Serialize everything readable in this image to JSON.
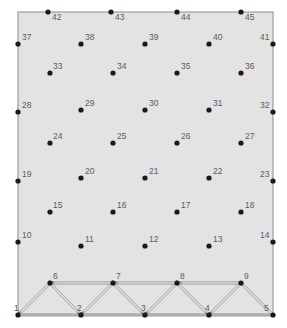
{
  "figure": {
    "type": "mesh-truss-diagram",
    "width": 287,
    "height": 328,
    "background_color": "#ffffff",
    "domain_fill_color": "#e3e3e3",
    "domain_stroke_color": "#8c8c8c",
    "node_color": "#1a1a1a",
    "member_color": "#8a8a8a",
    "label_color": "#5c5c5c",
    "domain_rect": {
      "x": 18,
      "y": 12,
      "width": 255,
      "height": 303
    },
    "node_radius": 2.6,
    "label_font_size": 8.5
  },
  "nodes": [
    {
      "id": "1",
      "label": "1",
      "x": 18,
      "y": 315,
      "lx": 14,
      "ly": 304,
      "role": "truss-bottom-corner"
    },
    {
      "id": "2",
      "label": "2",
      "x": 81,
      "y": 315,
      "lx": 77,
      "ly": 304,
      "role": "truss-bottom"
    },
    {
      "id": "3",
      "label": "3",
      "x": 145,
      "y": 315,
      "lx": 141,
      "ly": 304,
      "role": "truss-bottom"
    },
    {
      "id": "4",
      "label": "4",
      "x": 209,
      "y": 315,
      "lx": 205,
      "ly": 304,
      "role": "truss-bottom"
    },
    {
      "id": "5",
      "label": "5",
      "x": 273,
      "y": 315,
      "lx": 264,
      "ly": 304,
      "role": "truss-bottom-corner"
    },
    {
      "id": "6",
      "label": "6",
      "x": 50,
      "y": 283,
      "lx": 53,
      "ly": 272,
      "role": "truss-top"
    },
    {
      "id": "7",
      "label": "7",
      "x": 113,
      "y": 283,
      "lx": 116,
      "ly": 272,
      "role": "truss-top"
    },
    {
      "id": "8",
      "label": "8",
      "x": 177,
      "y": 283,
      "lx": 180,
      "ly": 272,
      "role": "truss-top"
    },
    {
      "id": "9",
      "label": "9",
      "x": 241,
      "y": 283,
      "lx": 244,
      "ly": 272,
      "role": "truss-top"
    },
    {
      "id": "10",
      "label": "10",
      "x": 18,
      "y": 242,
      "lx": 22,
      "ly": 231,
      "role": "boundary-left"
    },
    {
      "id": "11",
      "label": "11",
      "x": 81,
      "y": 246,
      "lx": 85,
      "ly": 235,
      "role": "interior"
    },
    {
      "id": "12",
      "label": "12",
      "x": 145,
      "y": 246,
      "lx": 149,
      "ly": 235,
      "role": "interior"
    },
    {
      "id": "13",
      "label": "13",
      "x": 209,
      "y": 246,
      "lx": 213,
      "ly": 235,
      "role": "interior"
    },
    {
      "id": "14",
      "label": "14",
      "x": 273,
      "y": 242,
      "lx": 260,
      "ly": 231,
      "role": "boundary-right"
    },
    {
      "id": "15",
      "label": "15",
      "x": 50,
      "y": 212,
      "lx": 53,
      "ly": 201,
      "role": "interior"
    },
    {
      "id": "16",
      "label": "16",
      "x": 113,
      "y": 212,
      "lx": 117,
      "ly": 201,
      "role": "interior"
    },
    {
      "id": "17",
      "label": "17",
      "x": 177,
      "y": 212,
      "lx": 181,
      "ly": 201,
      "role": "interior"
    },
    {
      "id": "18",
      "label": "18",
      "x": 241,
      "y": 212,
      "lx": 245,
      "ly": 201,
      "role": "interior"
    },
    {
      "id": "19",
      "label": "19",
      "x": 18,
      "y": 181,
      "lx": 22,
      "ly": 170,
      "role": "boundary-left"
    },
    {
      "id": "20",
      "label": "20",
      "x": 81,
      "y": 178,
      "lx": 85,
      "ly": 167,
      "role": "interior"
    },
    {
      "id": "21",
      "label": "21",
      "x": 145,
      "y": 178,
      "lx": 149,
      "ly": 167,
      "role": "interior"
    },
    {
      "id": "22",
      "label": "22",
      "x": 209,
      "y": 178,
      "lx": 213,
      "ly": 167,
      "role": "interior"
    },
    {
      "id": "23",
      "label": "23",
      "x": 273,
      "y": 181,
      "lx": 260,
      "ly": 170,
      "role": "boundary-right"
    },
    {
      "id": "24",
      "label": "24",
      "x": 50,
      "y": 143,
      "lx": 53,
      "ly": 132,
      "role": "interior"
    },
    {
      "id": "25",
      "label": "25",
      "x": 113,
      "y": 143,
      "lx": 117,
      "ly": 132,
      "role": "interior"
    },
    {
      "id": "26",
      "label": "26",
      "x": 177,
      "y": 143,
      "lx": 181,
      "ly": 132,
      "role": "interior"
    },
    {
      "id": "27",
      "label": "27",
      "x": 241,
      "y": 143,
      "lx": 245,
      "ly": 132,
      "role": "interior"
    },
    {
      "id": "28",
      "label": "28",
      "x": 18,
      "y": 112,
      "lx": 22,
      "ly": 101,
      "role": "boundary-left"
    },
    {
      "id": "29",
      "label": "29",
      "x": 81,
      "y": 110,
      "lx": 85,
      "ly": 99,
      "role": "interior"
    },
    {
      "id": "30",
      "label": "30",
      "x": 145,
      "y": 110,
      "lx": 149,
      "ly": 99,
      "role": "interior"
    },
    {
      "id": "31",
      "label": "31",
      "x": 209,
      "y": 110,
      "lx": 213,
      "ly": 99,
      "role": "interior"
    },
    {
      "id": "32",
      "label": "32",
      "x": 273,
      "y": 112,
      "lx": 260,
      "ly": 101,
      "role": "boundary-right"
    },
    {
      "id": "33",
      "label": "33",
      "x": 50,
      "y": 73,
      "lx": 53,
      "ly": 62,
      "role": "interior"
    },
    {
      "id": "34",
      "label": "34",
      "x": 113,
      "y": 73,
      "lx": 117,
      "ly": 62,
      "role": "interior"
    },
    {
      "id": "35",
      "label": "35",
      "x": 177,
      "y": 73,
      "lx": 181,
      "ly": 62,
      "role": "interior"
    },
    {
      "id": "36",
      "label": "36",
      "x": 241,
      "y": 73,
      "lx": 245,
      "ly": 62,
      "role": "interior"
    },
    {
      "id": "37",
      "label": "37",
      "x": 18,
      "y": 44,
      "lx": 22,
      "ly": 33,
      "role": "boundary-left"
    },
    {
      "id": "38",
      "label": "38",
      "x": 81,
      "y": 44,
      "lx": 85,
      "ly": 33,
      "role": "interior"
    },
    {
      "id": "39",
      "label": "39",
      "x": 145,
      "y": 44,
      "lx": 149,
      "ly": 33,
      "role": "interior"
    },
    {
      "id": "40",
      "label": "40",
      "x": 209,
      "y": 44,
      "lx": 213,
      "ly": 33,
      "role": "interior"
    },
    {
      "id": "41",
      "label": "41",
      "x": 273,
      "y": 44,
      "lx": 260,
      "ly": 33,
      "role": "boundary-right"
    },
    {
      "id": "42",
      "label": "42",
      "x": 48,
      "y": 12,
      "lx": 52,
      "ly": 13,
      "role": "boundary-top"
    },
    {
      "id": "43",
      "label": "43",
      "x": 111,
      "y": 12,
      "lx": 115,
      "ly": 13,
      "role": "boundary-top"
    },
    {
      "id": "44",
      "label": "44",
      "x": 177,
      "y": 12,
      "lx": 181,
      "ly": 13,
      "role": "boundary-top"
    },
    {
      "id": "45",
      "label": "45",
      "x": 241,
      "y": 12,
      "lx": 245,
      "ly": 13,
      "role": "boundary-top"
    }
  ],
  "members": [
    {
      "from": "1",
      "to": "2",
      "kind": "bottom-chord",
      "arrow": false
    },
    {
      "from": "2",
      "to": "3",
      "kind": "bottom-chord",
      "arrow": false
    },
    {
      "from": "3",
      "to": "4",
      "kind": "bottom-chord",
      "arrow": false
    },
    {
      "from": "4",
      "to": "5",
      "kind": "bottom-chord",
      "arrow": false
    },
    {
      "from": "7",
      "to": "6",
      "kind": "top-chord",
      "arrow": true
    },
    {
      "from": "8",
      "to": "7",
      "kind": "top-chord",
      "arrow": true
    },
    {
      "from": "9",
      "to": "8",
      "kind": "top-chord",
      "arrow": true
    },
    {
      "from": "6",
      "to": "1",
      "kind": "diagonal",
      "arrow": true
    },
    {
      "from": "6",
      "to": "2",
      "kind": "diagonal",
      "arrow": true
    },
    {
      "from": "7",
      "to": "2",
      "kind": "diagonal",
      "arrow": true
    },
    {
      "from": "7",
      "to": "3",
      "kind": "diagonal",
      "arrow": true
    },
    {
      "from": "8",
      "to": "3",
      "kind": "diagonal",
      "arrow": true
    },
    {
      "from": "8",
      "to": "4",
      "kind": "diagonal",
      "arrow": true
    },
    {
      "from": "9",
      "to": "4",
      "kind": "diagonal",
      "arrow": true
    },
    {
      "from": "9",
      "to": "5",
      "kind": "diagonal",
      "arrow": false
    }
  ]
}
